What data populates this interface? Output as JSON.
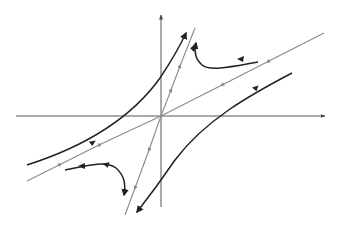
{
  "diagram": {
    "type": "phase-portrait",
    "colors": {
      "axis": "#555555",
      "eigenline": "#8a8a8a",
      "trajectory": "#222222",
      "background": "#ffffff"
    },
    "origin": [
      161,
      116
    ],
    "axes": {
      "x_axis": {
        "from": [
          16,
          116
        ],
        "to": [
          325,
          116
        ],
        "arrow": "right"
      },
      "y_axis": {
        "from": [
          161,
          207
        ],
        "to": [
          161,
          15
        ],
        "arrow": "up"
      }
    },
    "eigenlines": [
      {
        "name": "stable-eigenline",
        "from": [
          27,
          181
        ],
        "to": [
          324,
          33
        ],
        "flow": "toward-origin"
      },
      {
        "name": "unstable-eigenline",
        "from": [
          125,
          215
        ],
        "to": [
          195,
          28
        ],
        "flow": "away-from-origin"
      }
    ],
    "trajectories": [
      {
        "name": "trajectory-upper-left",
        "path": "M27,165 C80,148 130,120 160,78 C172,60 180,46 186,33"
      },
      {
        "name": "trajectory-upper-right",
        "path": "M258,62 C235,66 210,72 202,65 C196,60 194,52 196,43"
      },
      {
        "name": "trajectory-lower-left",
        "path": "M65,170 C85,166 105,160 116,168 C124,175 126,185 124,195"
      },
      {
        "name": "trajectory-lower-right",
        "path": "M292,73 C250,95 205,120 175,160 C160,182 148,198 137,212"
      }
    ]
  }
}
